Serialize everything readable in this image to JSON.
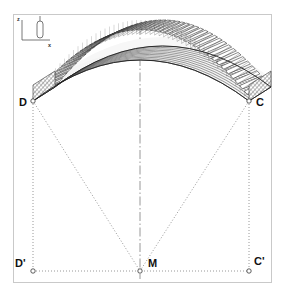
{
  "figure": {
    "kind": "engineering-geometry-diagram",
    "background_color": "#ffffff",
    "frame": {
      "name": "plot-border",
      "color": "#c9c9c9",
      "x": 13,
      "y": 14,
      "width": 259,
      "height": 269
    }
  },
  "axis_triad": {
    "name": "coordinate-axis-indicator",
    "z_label": "z",
    "x_label": "x",
    "origin_x": 22,
    "origin_y": 40,
    "z_tip_y": 20,
    "x_tip_x": 50,
    "color": "#555555",
    "marker_glyph": "capsule"
  },
  "points": [
    {
      "id": "D",
      "label": "D",
      "x": 33,
      "y": 101,
      "marker": "open-circle",
      "label_dx": -14,
      "label_dy": 5
    },
    {
      "id": "C",
      "label": "C",
      "x": 249,
      "y": 101,
      "marker": "open-circle",
      "label_dx": 7,
      "label_dy": 5
    },
    {
      "id": "Dp",
      "label": "D'",
      "x": 33,
      "y": 271,
      "marker": "open-circle",
      "label_dx": -18,
      "label_dy": -4
    },
    {
      "id": "M",
      "label": "M",
      "x": 140,
      "y": 271,
      "marker": "open-circle",
      "label_dx": 8,
      "label_dy": -4
    },
    {
      "id": "Cp",
      "label": "C'",
      "x": 249,
      "y": 271,
      "marker": "open-circle",
      "label_dx": 5,
      "label_dy": -6
    }
  ],
  "construction_lines": [
    {
      "name": "dotted-line-D-to-Dprime",
      "from": "D",
      "to": "Dp",
      "style": "dotted",
      "color": "#8d8d8d"
    },
    {
      "name": "dotted-line-C-to-Cprime",
      "from": "C",
      "to": "Cp",
      "style": "dotted",
      "color": "#8d8d8d"
    },
    {
      "name": "dotted-line-D-to-M",
      "from": "D",
      "to": "M",
      "style": "dotted",
      "color": "#8d8d8d"
    },
    {
      "name": "dotted-line-C-to-M",
      "from": "C",
      "to": "M",
      "style": "dotted",
      "color": "#8d8d8d"
    },
    {
      "name": "dotted-baseline-Dprime-Cprime",
      "from": "Dp",
      "to": "Cp",
      "style": "dotted",
      "color": "#8d8d8d"
    }
  ],
  "center_line": {
    "name": "vertical-centerline",
    "x": 140,
    "y_top": 26,
    "y_bottom": 279,
    "style": "dash-dot",
    "color": "#8d8d8d"
  },
  "vault": {
    "name": "barrel-vault-mesh",
    "springing_left_x": 33,
    "springing_right_x": 249,
    "springing_y": 101,
    "crown_x": 140,
    "crown_y": 34,
    "depth_dx": 22,
    "depth_dy": -14,
    "rib_count": 46,
    "ring_count": 11,
    "colors": {
      "mesh_line": "#3a3a3a",
      "rib_outline": "#2b2b2b",
      "rib_fill": "#ffffff",
      "shell_fill": "#f4f4f4",
      "end_face_fill": "#9a9a9a",
      "edge": "#222222"
    }
  },
  "colors": {
    "background": "#ffffff",
    "frame": "#c9c9c9",
    "dotted": "#8d8d8d",
    "text": "#111111"
  }
}
